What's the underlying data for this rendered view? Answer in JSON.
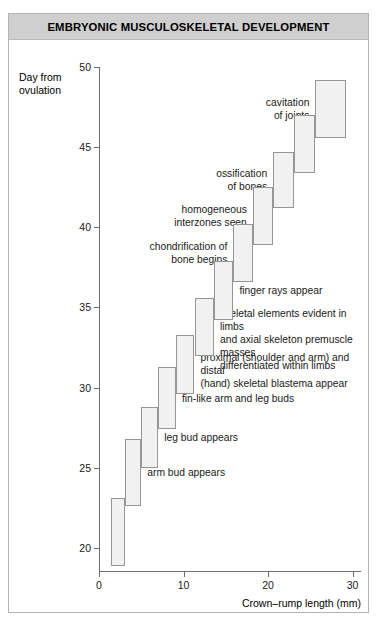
{
  "figure": {
    "title": "EMBRYONIC MUSCULOSKELETAL DEVELOPMENT",
    "accent_color": "#cfcfcf",
    "box_fill_color": "#f1f1f1",
    "box_border_color": "#969696",
    "axis_color": "#6e6e6e"
  },
  "chart_data": {
    "type": "bar",
    "title": "EMBRYONIC MUSCULOSKELETAL DEVELOPMENT",
    "xlabel": "Crown–rump length (mm)",
    "ylabel": "Day from ovulation",
    "xlim": [
      0,
      31
    ],
    "ylim": [
      18.5,
      50
    ],
    "xticks": [
      0,
      10,
      20,
      30
    ],
    "yticks": [
      20,
      25,
      30,
      35,
      40,
      45,
      50
    ],
    "grid": false,
    "legend": null,
    "note": "Staircase of stage boxes; each box spans a crown-rump length range (mm) on x and a day-from-ovulation range on y.",
    "boxes": [
      {
        "x0": 1.4,
        "x1": 3.1,
        "y0": 18.9,
        "y1": 23.1,
        "label": null
      },
      {
        "x0": 3.1,
        "x1": 5.0,
        "y0": 22.6,
        "y1": 26.8,
        "label": "arm bud appears"
      },
      {
        "x0": 5.0,
        "x1": 7.0,
        "y0": 25.0,
        "y1": 28.8,
        "label": "leg bud appears"
      },
      {
        "x0": 7.0,
        "x1": 9.1,
        "y0": 27.4,
        "y1": 31.3,
        "label": "fin-like arm and leg buds"
      },
      {
        "x0": 9.1,
        "x1": 11.3,
        "y0": 29.6,
        "y1": 33.3,
        "label": "proximal (shoulder and arm) and distal\n(hand) skeletal blastema appear"
      },
      {
        "x0": 11.3,
        "x1": 13.6,
        "y0": 32.0,
        "y1": 35.6,
        "label": "skeletal elements evident in limbs\nand axial skeleton premuscle masses\ndifferentiated within limbs"
      },
      {
        "x0": 13.6,
        "x1": 15.9,
        "y0": 34.2,
        "y1": 37.9,
        "label": "finger rays appear"
      },
      {
        "x0": 15.9,
        "x1": 18.2,
        "y0": 36.6,
        "y1": 40.2,
        "label": "chondrification of\nbone begins"
      },
      {
        "x0": 18.2,
        "x1": 20.6,
        "y0": 38.9,
        "y1": 42.5,
        "label": "homogeneous\ninterzones seen"
      },
      {
        "x0": 20.6,
        "x1": 23.1,
        "y0": 41.2,
        "y1": 44.7,
        "label": "ossification\nof bones"
      },
      {
        "x0": 23.1,
        "x1": 25.6,
        "y0": 43.4,
        "y1": 47.0,
        "label": null
      },
      {
        "x0": 25.6,
        "x1": 29.2,
        "y0": 45.6,
        "y1": 49.2,
        "label": "cavitation\nof joints"
      }
    ],
    "annotations": [
      {
        "text": "cavitation\nof joints",
        "align": "right"
      },
      {
        "text": "ossification\nof bones",
        "align": "right"
      },
      {
        "text": "homogeneous\ninterzones seen",
        "align": "right"
      },
      {
        "text": "chondrification of\nbone begins",
        "align": "right"
      },
      {
        "text": "finger rays appear",
        "align": "left"
      },
      {
        "text": "skeletal elements evident in limbs\nand axial skeleton premuscle masses\ndifferentiated within limbs",
        "align": "left"
      },
      {
        "text": "proximal (shoulder and arm) and distal\n(hand) skeletal blastema appear",
        "align": "left"
      },
      {
        "text": "fin-like arm and leg buds",
        "align": "left"
      },
      {
        "text": "leg bud appears",
        "align": "left"
      },
      {
        "text": "arm bud appears",
        "align": "left"
      }
    ]
  },
  "axes": {
    "y_label_line1": "Day from",
    "y_label_line2": "ovulation",
    "x_label": "Crown–rump length (mm)",
    "y_ticks": [
      "50",
      "45",
      "40",
      "35",
      "30",
      "25",
      "20"
    ],
    "x_ticks": [
      "0",
      "10",
      "20",
      "30"
    ]
  }
}
